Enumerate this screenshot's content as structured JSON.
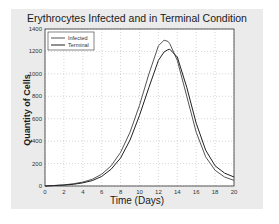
{
  "chart_data": {
    "type": "line",
    "title": "Erythrocytes Infected and in Terminal Condition",
    "xlabel": "Time (Days)",
    "ylabel": "Quantity of Cells",
    "xlim": [
      0,
      20
    ],
    "ylim": [
      0,
      1400
    ],
    "xticks": [
      0,
      2,
      4,
      6,
      8,
      10,
      12,
      14,
      16,
      18,
      20
    ],
    "yticks": [
      0,
      200,
      400,
      600,
      800,
      1000,
      1200,
      1400
    ],
    "grid": true,
    "legend_position": "upper-left",
    "x": [
      0,
      1,
      2,
      3,
      4,
      5,
      6,
      7,
      8,
      9,
      10,
      11,
      12,
      12.6,
      13,
      13.2,
      14,
      15,
      16,
      17,
      18,
      19,
      20
    ],
    "series": [
      {
        "name": "Infected",
        "color": "#555555",
        "values": [
          0,
          5,
          10,
          20,
          35,
          60,
          105,
          180,
          300,
          480,
          720,
          1000,
          1250,
          1300,
          1290,
          1270,
          1120,
          800,
          480,
          260,
          140,
          80,
          50
        ]
      },
      {
        "name": "Terminal",
        "color": "#222222",
        "values": [
          0,
          4,
          8,
          15,
          28,
          48,
          85,
          150,
          250,
          410,
          630,
          880,
          1120,
          1195,
          1215,
          1220,
          1150,
          880,
          560,
          320,
          180,
          115,
          80
        ]
      }
    ]
  }
}
